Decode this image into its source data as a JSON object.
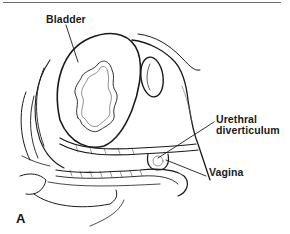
{
  "figure": {
    "panel_letter": "A",
    "labels": {
      "bladder": "Bladder",
      "urethral_line1": "Urethral",
      "urethral_line2": "diverticulum",
      "vagina": "Vagina"
    }
  }
}
